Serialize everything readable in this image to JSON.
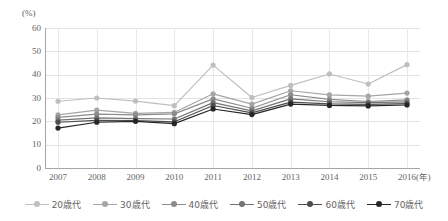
{
  "chart_data": {
    "type": "line",
    "title": "",
    "xlabel": "(年)",
    "ylabel": "(%)",
    "ylim": [
      0,
      60
    ],
    "yticks": [
      0,
      10,
      20,
      30,
      40,
      50,
      60
    ],
    "grid": true,
    "legend_position": "bottom",
    "categories": [
      "2007",
      "2008",
      "2009",
      "2010",
      "2011",
      "2012",
      "2013",
      "2014",
      "2015",
      "2016"
    ],
    "series": [
      {
        "name": "20歳代",
        "color": "#bfbfbf",
        "values": [
          28.6,
          30.0,
          28.7,
          26.7,
          44.1,
          30.2,
          35.4,
          40.3,
          36.0,
          44.3
        ]
      },
      {
        "name": "30歳代",
        "color": "#a6a6a6",
        "values": [
          22.8,
          24.8,
          23.4,
          23.8,
          31.8,
          27.4,
          33.1,
          31.3,
          30.8,
          32.1
        ]
      },
      {
        "name": "40歳代",
        "color": "#8c8c8c",
        "values": [
          21.7,
          23.1,
          22.8,
          23.2,
          29.6,
          25.6,
          31.4,
          29.4,
          28.5,
          29.2
        ]
      },
      {
        "name": "50歳代",
        "color": "#737373",
        "values": [
          20.5,
          21.5,
          21.2,
          21.0,
          28.0,
          24.5,
          29.6,
          28.4,
          28.0,
          28.3
        ]
      },
      {
        "name": "60歳代",
        "color": "#4d4d4d",
        "values": [
          19.6,
          20.4,
          20.3,
          19.8,
          26.8,
          23.6,
          28.2,
          27.5,
          27.3,
          27.6
        ]
      },
      {
        "name": "70歳代",
        "color": "#262626",
        "values": [
          17.1,
          19.6,
          20.0,
          19.0,
          25.3,
          22.9,
          27.4,
          26.8,
          26.6,
          27.0
        ]
      }
    ]
  },
  "axes": {
    "y_unit": "(%)",
    "x_unit": "(年)",
    "y_tick_labels": [
      "60",
      "50",
      "40",
      "30",
      "20",
      "10",
      "0"
    ],
    "x_tick_labels": [
      "2007",
      "2008",
      "2009",
      "2010",
      "2011",
      "2012",
      "2013",
      "2014",
      "2015",
      "2016"
    ]
  },
  "legend": {
    "items": [
      {
        "label": "20歳代",
        "color": "#bfbfbf"
      },
      {
        "label": "30歳代",
        "color": "#a6a6a6"
      },
      {
        "label": "40歳代",
        "color": "#8c8c8c"
      },
      {
        "label": "50歳代",
        "color": "#737373"
      },
      {
        "label": "60歳代",
        "color": "#4d4d4d"
      },
      {
        "label": "70歳代",
        "color": "#262626"
      }
    ]
  }
}
